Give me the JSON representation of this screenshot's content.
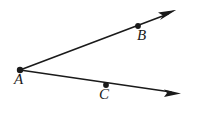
{
  "figure": {
    "kind": "geometry-diagram",
    "background_color": "#ffffff",
    "stroke_color": "#1a1a1a",
    "canvas": {
      "width": 197,
      "height": 116
    },
    "vertex": {
      "name": "A",
      "label": "A",
      "x": 20,
      "y": 70,
      "label_x": 14,
      "label_y": 72
    },
    "rays": [
      {
        "name": "ray-AB",
        "label": "AB",
        "from_x": 20,
        "from_y": 70,
        "to_x": 176,
        "to_y": 11,
        "arrow": "end",
        "stroke_width": 1.6
      },
      {
        "name": "ray-AC",
        "label": "AC",
        "from_x": 20,
        "from_y": 70,
        "to_x": 180,
        "to_y": 93,
        "arrow": "end",
        "stroke_width": 1.6
      }
    ],
    "points": [
      {
        "name": "point-A",
        "label": "A",
        "x": 20,
        "y": 70,
        "radius": 3.1,
        "label_x": 14,
        "label_y": 72
      },
      {
        "name": "point-B",
        "label": "B",
        "x": 138,
        "y": 26,
        "radius": 2.8,
        "label_x": 137,
        "label_y": 28
      },
      {
        "name": "point-C",
        "label": "C",
        "x": 106,
        "y": 85,
        "radius": 2.8,
        "label_x": 99,
        "label_y": 87
      }
    ]
  }
}
